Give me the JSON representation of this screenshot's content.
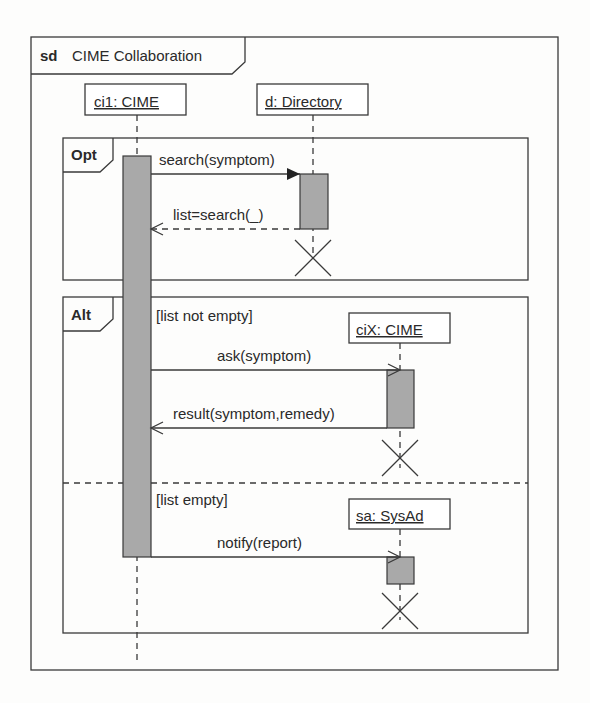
{
  "diagram": {
    "keyword": "sd",
    "title": "CIME Collaboration",
    "lifelines": [
      {
        "id": "ci1",
        "label": "ci1: CIME"
      },
      {
        "id": "d",
        "label": "d: Directory"
      },
      {
        "id": "ciX",
        "label": "ciX: CIME"
      },
      {
        "id": "sa",
        "label": "sa: SysAd"
      }
    ],
    "fragments": [
      {
        "operator": "Opt",
        "guards": []
      },
      {
        "operator": "Alt",
        "guards": [
          "[list not empty]",
          "[list empty]"
        ]
      }
    ],
    "messages": [
      {
        "label": "search(symptom)",
        "from": "ci1",
        "to": "d",
        "kind": "sync"
      },
      {
        "label": "list=search(_)",
        "from": "d",
        "to": "ci1",
        "kind": "reply"
      },
      {
        "label": "ask(symptom)",
        "from": "ci1",
        "to": "ciX",
        "kind": "async"
      },
      {
        "label": "result(symptom,remedy)",
        "from": "ciX",
        "to": "ci1",
        "kind": "async"
      },
      {
        "label": "notify(report)",
        "from": "ci1",
        "to": "sa",
        "kind": "async"
      }
    ],
    "destructions": [
      "d",
      "ciX",
      "sa"
    ]
  }
}
